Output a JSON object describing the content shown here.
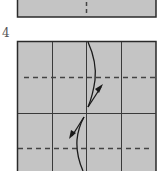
{
  "step": {
    "number": "4"
  },
  "colors": {
    "paper": "#c4c4c4",
    "border": "#2a2a2a",
    "grid": "#3a3a3a",
    "dash": "#444444",
    "arrow": "#1a1a1a"
  },
  "diagram": {
    "previous_step_panel": {
      "fold_line": "vertical-dashed-center"
    },
    "current_step_panel": {
      "columns": 4,
      "valley_folds": [
        "upper-horizontal-dashed",
        "lower-horizontal-dashed"
      ],
      "arrows": [
        "fold-up-arrow",
        "fold-down-arrow"
      ]
    }
  }
}
